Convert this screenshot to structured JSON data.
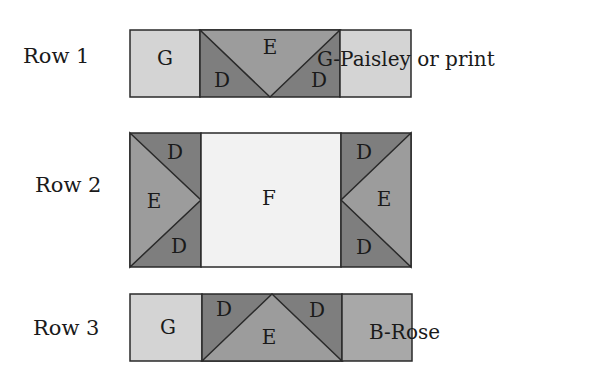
{
  "colors": {
    "G": "#d4d4d4",
    "E": "#9c9c9c",
    "D": "#7e7e7e",
    "F": "#f2f2f2",
    "B": "#a8a8a8",
    "stroke": "#2a2a2a"
  },
  "rows": [
    {
      "label": "Row 1",
      "left_block": "G",
      "center_top": "E",
      "center_left": "D",
      "center_right": "D",
      "right_block_note": "G-Paisley or print"
    },
    {
      "label": "Row 2",
      "left_top": "D",
      "left_middle": "E",
      "left_bottom": "D",
      "center_block": "F",
      "right_top": "D",
      "right_middle": "E",
      "right_bottom": "D"
    },
    {
      "label": "Row 3",
      "left_block": "G",
      "center_left": "D",
      "center_bottom": "E",
      "center_right": "D",
      "right_block_note": "B-Rose"
    }
  ]
}
